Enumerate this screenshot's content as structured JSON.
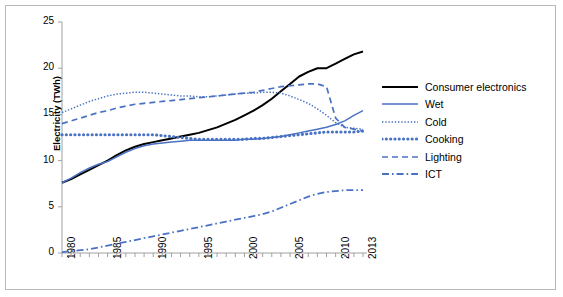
{
  "chart_data": {
    "type": "line",
    "title": "",
    "xlabel": "",
    "ylabel": "Electricity (TWh)",
    "xlim": [
      1980,
      2013
    ],
    "ylim": [
      0,
      25
    ],
    "yticks": [
      0,
      5,
      10,
      15,
      20,
      25
    ],
    "xticks": [
      1980,
      1985,
      1990,
      1995,
      2000,
      2005,
      2010,
      2013
    ],
    "grid": false,
    "legend_position": "right",
    "x": [
      1980,
      1981,
      1982,
      1983,
      1984,
      1985,
      1986,
      1987,
      1988,
      1989,
      1990,
      1991,
      1992,
      1993,
      1994,
      1995,
      1996,
      1997,
      1998,
      1999,
      2000,
      2001,
      2002,
      2003,
      2004,
      2005,
      2006,
      2007,
      2008,
      2009,
      2010,
      2011,
      2012,
      2013
    ],
    "series": [
      {
        "name": "Consumer electronics",
        "color": "#000000",
        "style": "solid",
        "values": [
          7.6,
          8.0,
          8.5,
          9.0,
          9.5,
          10.0,
          10.6,
          11.1,
          11.5,
          11.8,
          12.0,
          12.2,
          12.4,
          12.6,
          12.8,
          13.0,
          13.3,
          13.6,
          14.0,
          14.4,
          14.9,
          15.4,
          16.0,
          16.7,
          17.5,
          18.3,
          19.1,
          19.6,
          20.0,
          20.0,
          20.5,
          21.0,
          21.5,
          21.8
        ]
      },
      {
        "name": "Wet",
        "color": "#4a72c4",
        "style": "solid",
        "values": [
          7.6,
          8.1,
          8.7,
          9.2,
          9.6,
          9.9,
          10.4,
          10.9,
          11.3,
          11.6,
          11.8,
          11.9,
          12.0,
          12.1,
          12.2,
          12.2,
          12.2,
          12.2,
          12.2,
          12.2,
          12.3,
          12.3,
          12.4,
          12.5,
          12.6,
          12.8,
          13.0,
          13.2,
          13.4,
          13.6,
          13.9,
          14.3,
          14.9,
          15.4
        ]
      },
      {
        "name": "Cold",
        "color": "#4a72c4",
        "style": "dotted-fine",
        "values": [
          15.2,
          15.6,
          16.0,
          16.4,
          16.7,
          17.0,
          17.2,
          17.3,
          17.4,
          17.4,
          17.3,
          17.2,
          17.1,
          17.0,
          17.0,
          16.9,
          16.9,
          17.0,
          17.1,
          17.2,
          17.3,
          17.3,
          17.4,
          17.4,
          17.3,
          17.0,
          16.6,
          16.2,
          15.6,
          14.9,
          14.1,
          13.6,
          13.5,
          13.4
        ]
      },
      {
        "name": "Cooking",
        "color": "#4a72c4",
        "style": "dotted-thick",
        "values": [
          12.8,
          12.8,
          12.8,
          12.8,
          12.8,
          12.8,
          12.8,
          12.8,
          12.8,
          12.8,
          12.8,
          12.7,
          12.6,
          12.5,
          12.4,
          12.3,
          12.3,
          12.3,
          12.3,
          12.3,
          12.3,
          12.4,
          12.4,
          12.5,
          12.6,
          12.7,
          12.8,
          12.9,
          13.0,
          13.1,
          13.1,
          13.1,
          13.1,
          13.2
        ]
      },
      {
        "name": "Lighting",
        "color": "#4a72c4",
        "style": "dashed",
        "values": [
          14.0,
          14.3,
          14.6,
          14.9,
          15.2,
          15.4,
          15.7,
          15.9,
          16.1,
          16.2,
          16.3,
          16.4,
          16.5,
          16.6,
          16.7,
          16.8,
          16.9,
          17.0,
          17.1,
          17.2,
          17.3,
          17.4,
          17.6,
          17.8,
          18.0,
          18.1,
          18.2,
          18.3,
          18.3,
          18.0,
          14.6,
          13.6,
          13.4,
          13.2
        ]
      },
      {
        "name": "ICT",
        "color": "#4a72c4",
        "style": "dash-dot",
        "values": [
          0.1,
          0.2,
          0.3,
          0.4,
          0.6,
          0.8,
          1.0,
          1.2,
          1.4,
          1.6,
          1.8,
          2.0,
          2.2,
          2.4,
          2.6,
          2.8,
          3.0,
          3.2,
          3.4,
          3.6,
          3.8,
          4.0,
          4.2,
          4.5,
          4.9,
          5.3,
          5.7,
          6.1,
          6.4,
          6.6,
          6.7,
          6.8,
          6.8,
          6.8
        ]
      }
    ]
  },
  "legend": {
    "items": [
      {
        "label": "Consumer electronics"
      },
      {
        "label": "Wet"
      },
      {
        "label": "Cold"
      },
      {
        "label": "Cooking"
      },
      {
        "label": "Lighting"
      },
      {
        "label": "ICT"
      }
    ]
  }
}
